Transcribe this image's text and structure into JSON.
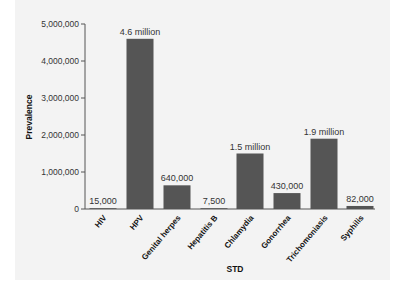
{
  "chart_data": {
    "type": "bar",
    "title": "",
    "xlabel": "STD",
    "ylabel": "Prevalence",
    "ylim": [
      0,
      5000000
    ],
    "yticks": [
      0,
      1000000,
      2000000,
      3000000,
      4000000,
      5000000
    ],
    "ytick_labels": [
      "0",
      "1,000,000",
      "2,000,000",
      "3,000,000",
      "4,000,000",
      "5,000,000"
    ],
    "grid": false,
    "legend": null,
    "categories": [
      "HIV",
      "HPV",
      "Genital herpes",
      "Hepatitis B",
      "Chlamydia",
      "Gonorrhea",
      "Trichomoniasis",
      "Syphilis"
    ],
    "values": [
      15000,
      4600000,
      640000,
      7500,
      1500000,
      430000,
      1900000,
      82000
    ],
    "data_labels": [
      "15,000",
      "4.6 million",
      "640,000",
      "7,500",
      "1.5 million",
      "430,000",
      "1.9 million",
      "82,000"
    ],
    "colors": {
      "bar": "#555555",
      "axis": "#555555",
      "background": "#f3f3f3"
    }
  }
}
